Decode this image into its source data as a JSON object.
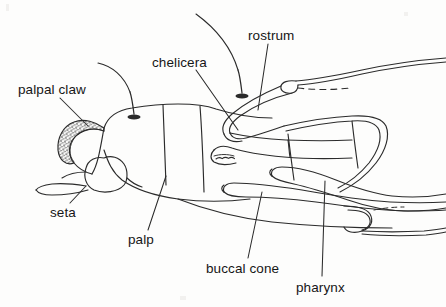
{
  "figure": {
    "style": "ink-line-drawing",
    "background_color": "#fdfdfc",
    "ink_color": "#2b2b2b",
    "label_color": "#161616"
  },
  "labels": [
    {
      "id": "palpal-claw",
      "text": "palpal claw",
      "x": 18,
      "y": 90,
      "anchor": "start"
    },
    {
      "id": "seta",
      "text": "seta",
      "x": 50,
      "y": 213,
      "anchor": "start"
    },
    {
      "id": "palp",
      "text": "palp",
      "x": 128,
      "y": 240,
      "anchor": "start"
    },
    {
      "id": "chelicera",
      "text": "chelicera",
      "x": 152,
      "y": 63,
      "anchor": "start"
    },
    {
      "id": "rostrum",
      "text": "rostrum",
      "x": 248,
      "y": 36,
      "anchor": "start"
    },
    {
      "id": "buccal-cone",
      "text": "buccal cone",
      "x": 206,
      "y": 269,
      "anchor": "start"
    },
    {
      "id": "pharynx",
      "text": "pharynx",
      "x": 296,
      "y": 288,
      "anchor": "start"
    }
  ],
  "leader_lines": [
    {
      "id": "leader-palpal-claw",
      "from": [
        60,
        98
      ],
      "to": [
        88,
        126
      ]
    },
    {
      "id": "leader-seta",
      "from": [
        70,
        203
      ],
      "to": [
        86,
        186
      ]
    },
    {
      "id": "leader-palp",
      "from": [
        148,
        230
      ],
      "to": [
        166,
        176
      ]
    },
    {
      "id": "leader-chelicera",
      "from": [
        196,
        70
      ],
      "to": [
        238,
        130
      ]
    },
    {
      "id": "leader-rostrum",
      "from": [
        268,
        44
      ],
      "to": [
        258,
        110
      ]
    },
    {
      "id": "leader-buccal-cone",
      "from": [
        248,
        258
      ],
      "to": [
        262,
        192
      ]
    },
    {
      "id": "leader-pharynx",
      "from": [
        322,
        276
      ],
      "to": [
        325,
        181
      ]
    }
  ],
  "structures": [
    {
      "id": "palpal-claw",
      "kind": "stippled-crescent",
      "note": "textured curved claw at anterior tip of palp"
    },
    {
      "id": "seta",
      "kind": "tapered-bristle",
      "note": "long bristle projecting antero-ventrally"
    },
    {
      "id": "palp",
      "kind": "segmented-limb",
      "note": "segmented palp forming body of gnathosoma"
    },
    {
      "id": "chelicera",
      "kind": "blade-with-denticles",
      "note": "pointed blade with serrated distal teeth"
    },
    {
      "id": "rostrum",
      "kind": "hooked-stylet",
      "note": "long hooked stylet extending posteriorly"
    },
    {
      "id": "buccal-cone",
      "kind": "elongate-tube",
      "note": "slender double-walled tube"
    },
    {
      "id": "pharynx",
      "kind": "elongate-tube",
      "note": "wavy double-walled tube posterior to buccal cone"
    }
  ],
  "seta_bases": [
    {
      "id": "seta-base-palp",
      "x": 134,
      "y": 115
    },
    {
      "id": "seta-base-dorsal",
      "x": 242,
      "y": 95
    }
  ],
  "curved_setae": [
    {
      "id": "seta-hair-palp",
      "note": "long hair arcing up-left from palp seta base"
    },
    {
      "id": "seta-hair-dorsal",
      "note": "long hair arcing up from dorsal seta base"
    }
  ]
}
